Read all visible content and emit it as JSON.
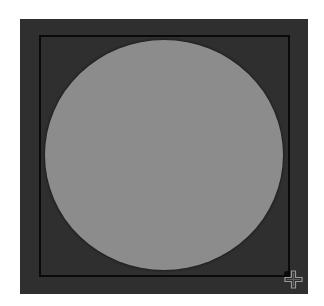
{
  "canvas": {
    "background_color": "#2f2f2f",
    "shape": {
      "type": "ellipse",
      "fill_color": "#8c8c8c",
      "bounding_box_color": "#0a0a0a"
    },
    "cursor": {
      "icon": "crosshair-move-icon"
    }
  }
}
